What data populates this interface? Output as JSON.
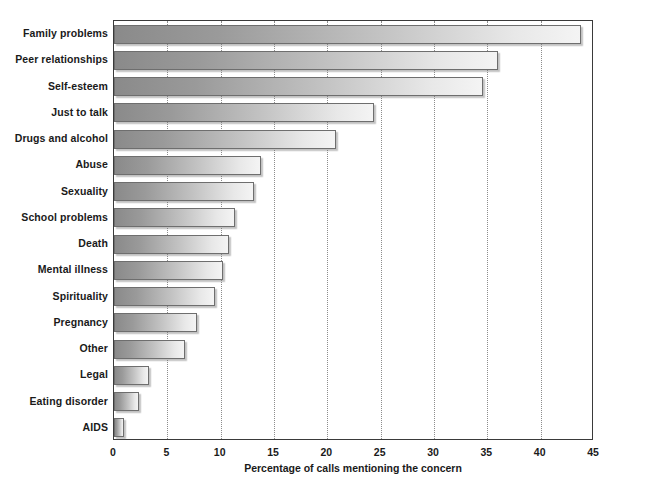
{
  "chart_data": {
    "type": "bar",
    "orientation": "horizontal",
    "title": "",
    "xlabel": "Percentage of calls mentioning the concern",
    "ylabel": "",
    "xlim": [
      0,
      45
    ],
    "xticks": [
      0,
      5,
      10,
      15,
      20,
      25,
      30,
      35,
      40,
      45
    ],
    "xtick_labels": [
      "0",
      "5",
      "10",
      "15",
      "20",
      "25",
      "30",
      "35",
      "40",
      "45"
    ],
    "grid": "vertical-dotted",
    "legend": "none",
    "categories": [
      "Family problems",
      "Peer relationships",
      "Self-esteem",
      "Just to talk",
      "Drugs and alcohol",
      "Abuse",
      "Sexuality",
      "School problems",
      "Death",
      "Mental illness",
      "Spirituality",
      "Pregnancy",
      "Other",
      "Legal",
      "Eating disorder",
      "AIDS"
    ],
    "values": [
      43.8,
      36.0,
      34.6,
      24.4,
      20.8,
      13.8,
      13.1,
      11.3,
      10.8,
      10.2,
      9.5,
      7.8,
      6.7,
      3.3,
      2.3,
      0.9
    ]
  },
  "colors": {
    "bar_gradient_start": "#8a8a8a",
    "bar_gradient_end": "#f4f4f4",
    "bar_border": "#6e6e6e",
    "axis": "#3a3a3a",
    "gridline": "#8c8c8c",
    "text": "#1a1a1a",
    "background": "#ffffff"
  }
}
